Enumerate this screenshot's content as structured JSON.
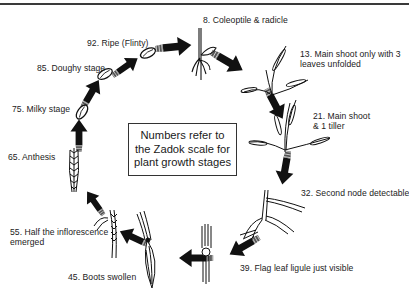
{
  "figure": {
    "note": {
      "lines": [
        "Numbers refer to",
        "the Zadok scale for",
        "plant growth stages"
      ]
    },
    "stages": [
      {
        "code": 8,
        "label": "8. Coleoptile & radicle",
        "icon": "seedling-icon"
      },
      {
        "code": 13,
        "label_lines": [
          "13. Main shoot only with 3",
          "leaves unfolded"
        ],
        "icon": "three-leaf-shoot-icon"
      },
      {
        "code": 21,
        "label_lines": [
          "21. Main shoot",
          "& 1 tiller"
        ],
        "icon": "tillering-plant-icon"
      },
      {
        "code": 32,
        "label": "32. Second node detectable",
        "icon": "node-stem-icon"
      },
      {
        "code": 39,
        "label": "39. Flag leaf ligule just visible",
        "icon": "flag-leaf-ligule-icon"
      },
      {
        "code": 45,
        "label": "45. Boots swollen",
        "icon": "swollen-boot-icon"
      },
      {
        "code": 55,
        "label_lines": [
          "55. Half the inflorescence",
          "emerged"
        ],
        "icon": "emerging-ear-icon"
      },
      {
        "code": 65,
        "label": "65. Anthesis",
        "icon": "flowering-ear-icon"
      },
      {
        "code": 75,
        "label": "75. Milky stage",
        "icon": "milky-grain-icon"
      },
      {
        "code": 85,
        "label": "85. Doughy stage",
        "icon": "doughy-grain-icon"
      },
      {
        "code": 92,
        "label": "92. Ripe (Flinty)",
        "icon": "ripe-grain-icon"
      }
    ],
    "colors": {
      "ink": "#111111",
      "text": "#222222",
      "rule": "#3a3a3a",
      "background": "#ffffff"
    }
  }
}
